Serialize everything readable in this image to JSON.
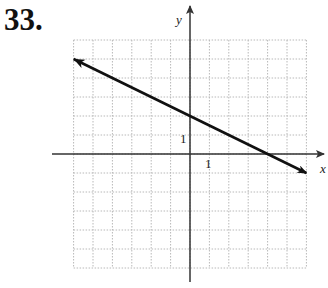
{
  "problem_number": "33.",
  "colors": {
    "grid": "#b8b8b8",
    "axis": "#333333",
    "line": "#111111"
  },
  "chart_data": {
    "type": "line",
    "title": "",
    "xlabel": "x",
    "ylabel": "y",
    "xlim": [
      -6,
      6
    ],
    "ylim": [
      -6,
      6
    ],
    "grid": true,
    "tick_labels": {
      "x": [
        "1"
      ],
      "y": [
        "1"
      ]
    },
    "series": [
      {
        "name": "line",
        "x": [
          -6,
          0,
          4,
          6
        ],
        "y": [
          5,
          2,
          0,
          -1
        ],
        "arrows": "both"
      }
    ],
    "equation_implied": "y = -0.5x + 2"
  }
}
